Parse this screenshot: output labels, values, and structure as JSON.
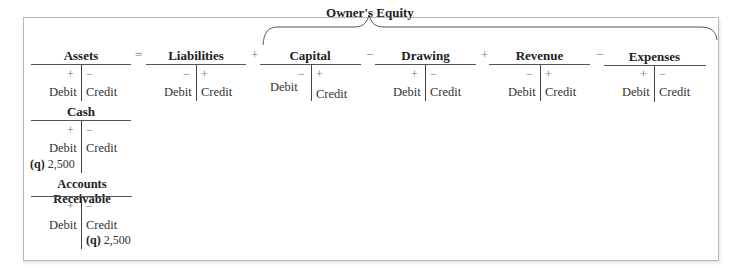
{
  "equation": {
    "group_label": "Owner's Equity",
    "operators": {
      "eq": "=",
      "plus1": "+",
      "minus1": "−",
      "plus2": "+",
      "minus2": "−"
    }
  },
  "accounts": [
    {
      "title": "Assets",
      "left_sign": "+",
      "right_sign": "−",
      "debit": "Debit",
      "credit": "Credit"
    },
    {
      "title": "Liabilities",
      "left_sign": "−",
      "right_sign": "+",
      "debit": "Debit",
      "credit": "Credit"
    },
    {
      "title": "Capital",
      "left_sign": "−",
      "right_sign": "+",
      "debit": "Debit",
      "credit": "Credit"
    },
    {
      "title": "Drawing",
      "left_sign": "+",
      "right_sign": "−",
      "debit": "Debit",
      "credit": "Credit"
    },
    {
      "title": "Revenue",
      "left_sign": "−",
      "right_sign": "+",
      "debit": "Debit",
      "credit": "Credit"
    },
    {
      "title": "Expenses",
      "left_sign": "+",
      "right_sign": "−",
      "debit": "Debit",
      "credit": "Credit"
    }
  ],
  "sub_accounts": [
    {
      "title": "Cash",
      "left_sign": "+",
      "right_sign": "−",
      "debit": "Debit",
      "credit": "Credit",
      "debit_entry": {
        "ref": "(q)",
        "amount": "2,500"
      }
    },
    {
      "title": "Accounts Receivable",
      "left_sign": "+",
      "right_sign": "−",
      "debit": "Debit",
      "credit": "Credit",
      "credit_entry": {
        "ref": "(q)",
        "amount": "2,500"
      }
    }
  ]
}
